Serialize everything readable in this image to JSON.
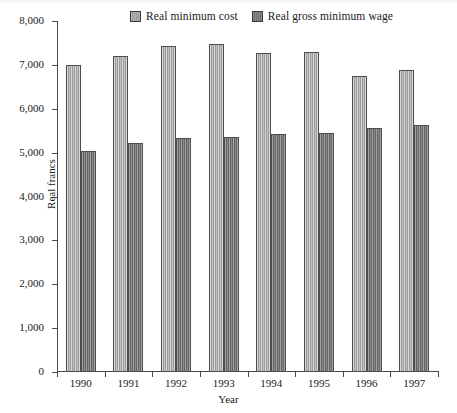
{
  "chart_data": {
    "type": "bar",
    "title": "",
    "xlabel": "Year",
    "ylabel": "Real francs",
    "categories": [
      "1990",
      "1991",
      "1992",
      "1993",
      "1994",
      "1995",
      "1996",
      "1997"
    ],
    "series": [
      {
        "name": "Real minimum cost",
        "color": "#ababab",
        "values": [
          7000,
          7200,
          7430,
          7480,
          7270,
          7290,
          6750,
          6880
        ]
      },
      {
        "name": "Real gross minimum wage",
        "color": "#7b7b7b",
        "values": [
          5040,
          5210,
          5340,
          5360,
          5420,
          5450,
          5560,
          5620
        ]
      }
    ],
    "ylim": [
      0,
      8000
    ],
    "ytick_values": [
      0,
      1000,
      2000,
      3000,
      4000,
      5000,
      6000,
      7000,
      8000
    ],
    "ytick_labels": [
      "0",
      "1,000",
      "2,000",
      "3,000",
      "4,000",
      "5,000",
      "6,000",
      "7,000",
      "8,000"
    ],
    "grid": false,
    "legend_position": "top-center"
  },
  "legend": {
    "entries": [
      {
        "label": "Real minimum cost",
        "swatch": "light-hatched-swatch"
      },
      {
        "label": "Real gross minimum wage",
        "swatch": "dark-hatched-swatch"
      }
    ]
  }
}
